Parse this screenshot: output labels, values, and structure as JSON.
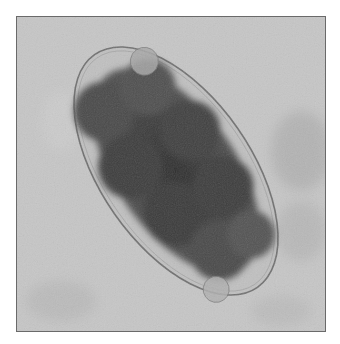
{
  "image": {
    "description": "Grayscale micrograph of an oval egg containing a dark segmented (morula-stage) mass",
    "colors": {
      "page_background": "#ffffff",
      "field_background": "#c4c4c4",
      "field_mottle": "#b2b2b2",
      "shell_outline": "#6e6e6e",
      "shell_interior": "#bdbdbd",
      "cell_mass_dark": "#3a3a3a",
      "cell_mass_mid": "#555555",
      "blastomere_light": "#9a9a9a",
      "frame_border": "#6a6a6a"
    }
  }
}
